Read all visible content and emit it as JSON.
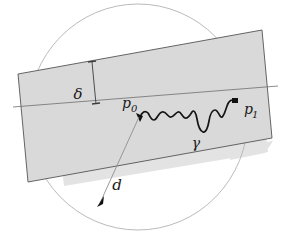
{
  "figure": {
    "kind": "geometry-diagram",
    "background_color": "#ffffff"
  },
  "colors": {
    "band_fill": "#d9d9d9",
    "band_shadow": "#e2e2e2",
    "band_stroke": "#4d4d4d",
    "circle_stroke": "#b0b0b0",
    "curve_stroke": "#1a1a1a",
    "leader_stroke": "#8c8c8c",
    "label_color": "#1a1a1a",
    "center_line_stroke": "#6e6e6e"
  },
  "labels": {
    "delta": {
      "text": "δ",
      "name": "band-width-label",
      "meaning": "strip half-width measure",
      "x": 78,
      "y": 94
    },
    "p0": {
      "base": "p",
      "sub": "0",
      "name": "point-p0-label",
      "x": 132,
      "y": 110
    },
    "p1": {
      "base": "p",
      "sub": "1",
      "name": "point-p1-label",
      "x": 245,
      "y": 115
    },
    "gamma": {
      "text": "γ",
      "name": "curve-gamma-label",
      "x": 196,
      "y": 144
    },
    "d": {
      "text": "d",
      "name": "radius-d-label",
      "x": 117,
      "y": 186
    }
  },
  "elements": {
    "circle": {
      "name": "bounding-circle",
      "cx": 138,
      "cy": 117,
      "rx": 110,
      "ry": 113
    },
    "band": {
      "name": "shaded-strip",
      "angle_deg": -9.5
    },
    "delta_measure": {
      "name": "delta-measure-line",
      "x": 91,
      "y_top": 71,
      "y_bottom": 110
    },
    "radius_arrow": {
      "name": "radius-arrow",
      "from_x": 139,
      "from_y": 116,
      "to_x": 99,
      "to_y": 204
    },
    "marker_p0": {
      "name": "point-p0-marker",
      "x": 139,
      "y": 116
    },
    "marker_p1": {
      "name": "point-p1-marker",
      "x": 235,
      "y": 101
    }
  }
}
